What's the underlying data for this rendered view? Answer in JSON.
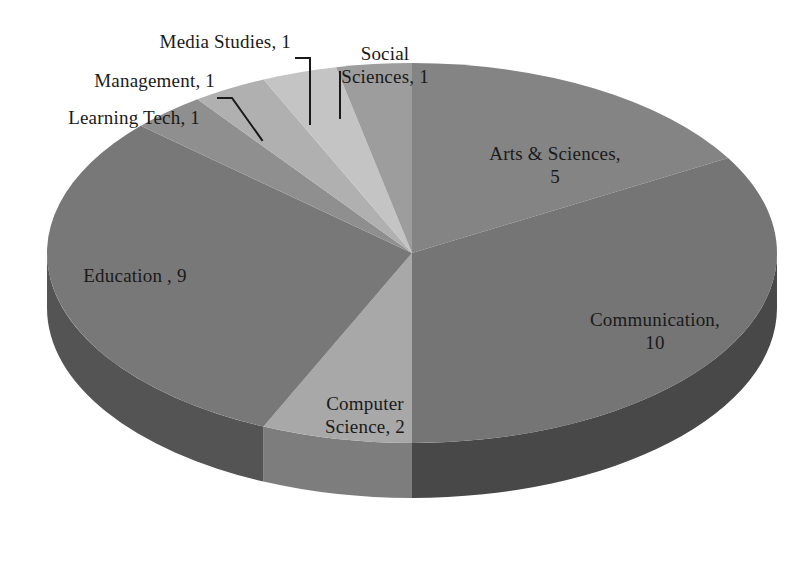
{
  "chart_data": {
    "type": "pie",
    "title": "",
    "subtitle": "",
    "xlabel": "",
    "ylabel": "",
    "total": 29,
    "three_d": true,
    "legend": "none",
    "labels_mode": "category-name-and-value",
    "grid": false,
    "categories": [
      "Arts & Sciences",
      "Communication",
      "Computer Science",
      "Education",
      "Learning Tech",
      "Management",
      "Media Studies",
      "Social Sciences"
    ],
    "values": [
      5,
      10,
      2,
      9,
      1,
      1,
      1,
      1
    ],
    "slices": [
      {
        "name": "Arts & Sciences",
        "value": 5,
        "label_text": "Arts & Sciences,\n5",
        "start_angle": 0,
        "sweep_angle": 62.07,
        "percent": 17.2,
        "top_color": "#848484",
        "side_color": "#5e5e5e",
        "label_placement": "inside",
        "leader_line": false
      },
      {
        "name": "Communication",
        "value": 10,
        "label_text": "Communication,\n10",
        "start_angle": 62.07,
        "sweep_angle": 124.14,
        "percent": 34.5,
        "top_color": "#757575",
        "side_color": "#484848",
        "label_placement": "inside",
        "leader_line": false
      },
      {
        "name": "Computer Science",
        "value": 2,
        "label_text": "Computer\nScience, 2",
        "start_angle": 186.21,
        "sweep_angle": 24.83,
        "percent": 6.9,
        "top_color": "#a8a8a8",
        "side_color": "#7d7d7d",
        "label_placement": "inside",
        "leader_line": false
      },
      {
        "name": "Education",
        "value": 9,
        "label_text": "Education , 9",
        "start_angle": 211.04,
        "sweep_angle": 111.72,
        "percent": 31.0,
        "top_color": "#787878",
        "side_color": "#545454",
        "label_placement": "inside",
        "leader_line": false
      },
      {
        "name": "Learning Tech",
        "value": 1,
        "label_text": "Learning Tech, 1",
        "start_angle": 322.76,
        "sweep_angle": 12.41,
        "percent": 3.4,
        "top_color": "#8f8f8f",
        "side_color": "#6a6a6a",
        "label_placement": "outside",
        "leader_line": false
      },
      {
        "name": "Management",
        "value": 1,
        "label_text": "Management, 1",
        "start_angle": 335.17,
        "sweep_angle": 12.41,
        "percent": 3.4,
        "top_color": "#b0b0b0",
        "side_color": "#898989",
        "label_placement": "outside",
        "leader_line": true
      },
      {
        "name": "Media Studies",
        "value": 1,
        "label_text": "Media Studies, 1",
        "start_angle": 347.59,
        "sweep_angle": 12.41,
        "percent": 3.4,
        "top_color": "#c4c4c4",
        "side_color": "#9a9a9a",
        "label_placement": "outside",
        "leader_line": true
      },
      {
        "name": "Social Sciences",
        "value": 1,
        "label_text": "Social\nSciences, 1",
        "start_angle": 0,
        "sweep_angle": 0,
        "percent": 3.4,
        "top_color": "#9d9d9d",
        "side_color": "#747474",
        "label_placement": "outside",
        "leader_line": true,
        "note": "rendered immediately counter-clockwise of 12 o'clock"
      }
    ],
    "geometry": {
      "center_x": 412,
      "center_y": 253,
      "radius_x": 365,
      "radius_y": 190,
      "depth": 55
    },
    "colors": {
      "background": "#ffffff",
      "text": "#1a1a1a",
      "leader_line": "#1a1a1a"
    }
  },
  "labels": {
    "arts_sciences": "Arts & Sciences,\n5",
    "communication": "Communication,\n10",
    "computer_science": "Computer\nScience, 2",
    "education": "Education , 9",
    "learning_tech": "Learning Tech, 1",
    "management": "Management, 1",
    "media_studies": "Media Studies, 1",
    "social_sciences": "Social\nSciences, 1"
  }
}
